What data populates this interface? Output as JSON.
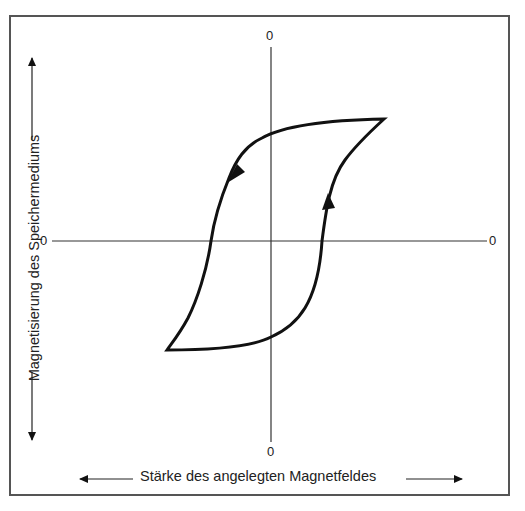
{
  "diagram": {
    "type": "hysteresis-loop",
    "x_axis": {
      "label": "Stärke des angelegten Magnetfeldes",
      "origin_label_left": "0",
      "origin_label_right": "0"
    },
    "y_axis": {
      "label": "Magnetisierung des Speichermediums",
      "origin_label_top": "0",
      "origin_label_bottom": "0"
    },
    "curve": {
      "upper_right_tip": [
        384,
        119
      ],
      "lower_left_tip": [
        167,
        350
      ],
      "direction_arrows": [
        "down-left on upper/left branch",
        "up on right branch"
      ]
    },
    "colors": {
      "line": "#111111",
      "axis": "#222222",
      "frame": "#555555",
      "background": "#ffffff"
    }
  }
}
